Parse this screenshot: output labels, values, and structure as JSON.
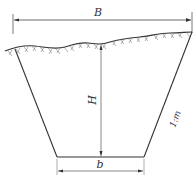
{
  "diagram": {
    "type": "trapezoidal-channel-cross-section",
    "labels": {
      "top_width": "B",
      "depth": "H",
      "bottom_width": "b",
      "side_slope": "1:m"
    },
    "colors": {
      "line": "#333333",
      "background": "#ffffff"
    }
  }
}
